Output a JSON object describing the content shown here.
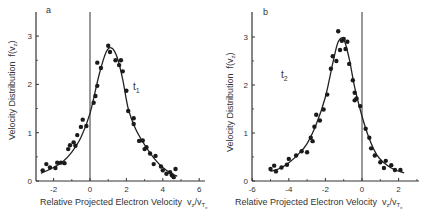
{
  "chart_data": [
    {
      "type": "scatter",
      "panel_label": "a",
      "curve_label": "t",
      "curve_label_sub": "1",
      "xlabel": "Relative Projected Electron Velocity",
      "xlabel_unit": "vz/vTe",
      "ylabel": "Velocity Distribution",
      "ylabel_unit": "f(vz)",
      "xlim": [
        -3,
        6
      ],
      "ylim": [
        0,
        3.5
      ],
      "xticks": [
        -2,
        0,
        2,
        4,
        6
      ],
      "yticks": [
        0,
        1,
        2,
        3
      ],
      "vertical_line_x": 0,
      "grid": false,
      "series": [
        {
          "name": "measured",
          "points": [
            [
              -2.6,
              0.22
            ],
            [
              -2.4,
              0.35
            ],
            [
              -2.2,
              0.28
            ],
            [
              -1.9,
              0.27
            ],
            [
              -1.8,
              0.38
            ],
            [
              -1.6,
              0.38
            ],
            [
              -1.4,
              0.37
            ],
            [
              -1.2,
              0.66
            ],
            [
              -1.1,
              0.74
            ],
            [
              -0.9,
              0.8
            ],
            [
              -0.8,
              0.73
            ],
            [
              -0.7,
              0.95
            ],
            [
              -0.5,
              1.12
            ],
            [
              -0.4,
              1.27
            ],
            [
              -0.2,
              1.14
            ],
            [
              0.2,
              1.62
            ],
            [
              0.3,
              1.76
            ],
            [
              0.4,
              1.97
            ],
            [
              0.4,
              2.45
            ],
            [
              0.6,
              2.34
            ],
            [
              1.0,
              2.8
            ],
            [
              1.1,
              2.67
            ],
            [
              1.4,
              2.5
            ],
            [
              1.6,
              2.4
            ],
            [
              1.7,
              2.5
            ],
            [
              1.8,
              2.27
            ],
            [
              2.0,
              1.87
            ],
            [
              2.1,
              1.45
            ],
            [
              2.4,
              1.3
            ],
            [
              2.4,
              1.18
            ],
            [
              2.7,
              0.83
            ],
            [
              2.9,
              0.84
            ],
            [
              3.0,
              0.66
            ],
            [
              3.1,
              0.7
            ],
            [
              3.3,
              0.57
            ],
            [
              3.5,
              0.35
            ],
            [
              3.6,
              0.52
            ],
            [
              3.9,
              0.3
            ],
            [
              4.0,
              0.22
            ],
            [
              4.2,
              0.15
            ],
            [
              4.4,
              0.18
            ],
            [
              4.5,
              0.12
            ],
            [
              4.6,
              0.08
            ],
            [
              4.7,
              0.25
            ]
          ]
        },
        {
          "name": "fit",
          "points": [
            [
              -2.7,
              0.16
            ],
            [
              -2.0,
              0.28
            ],
            [
              -1.5,
              0.4
            ],
            [
              -1.0,
              0.6
            ],
            [
              -0.5,
              0.9
            ],
            [
              0.0,
              1.4
            ],
            [
              0.5,
              2.2
            ],
            [
              0.9,
              2.68
            ],
            [
              1.2,
              2.75
            ],
            [
              1.5,
              2.55
            ],
            [
              1.8,
              2.1
            ],
            [
              2.1,
              1.5
            ],
            [
              2.5,
              1.08
            ],
            [
              3.0,
              0.75
            ],
            [
              3.5,
              0.48
            ],
            [
              4.0,
              0.28
            ],
            [
              4.5,
              0.15
            ],
            [
              4.8,
              0.1
            ]
          ]
        }
      ]
    },
    {
      "type": "scatter",
      "panel_label": "b",
      "curve_label": "t",
      "curve_label_sub": "2",
      "xlabel": "Relative Projected Electron Velocity",
      "xlabel_unit": "vz/vTe",
      "ylabel": "Velocity Distribution",
      "ylabel_unit": "f(vz)",
      "xlim": [
        -6,
        3
      ],
      "ylim": [
        0,
        3.5
      ],
      "xticks": [
        -6,
        -4,
        -2,
        0,
        2
      ],
      "yticks": [
        0,
        1,
        2,
        3
      ],
      "vertical_line_x": 0,
      "grid": false,
      "series": [
        {
          "name": "measured",
          "points": [
            [
              -5.0,
              0.25
            ],
            [
              -4.8,
              0.32
            ],
            [
              -4.7,
              0.2
            ],
            [
              -4.4,
              0.28
            ],
            [
              -4.1,
              0.34
            ],
            [
              -4.0,
              0.46
            ],
            [
              -3.6,
              0.53
            ],
            [
              -3.3,
              0.62
            ],
            [
              -3.0,
              0.6
            ],
            [
              -2.8,
              0.9
            ],
            [
              -2.7,
              0.83
            ],
            [
              -2.6,
              1.13
            ],
            [
              -2.5,
              1.38
            ],
            [
              -2.3,
              1.26
            ],
            [
              -2.1,
              1.49
            ],
            [
              -1.9,
              1.8
            ],
            [
              -1.7,
              2.34
            ],
            [
              -1.6,
              2.6
            ],
            [
              -1.4,
              2.5
            ],
            [
              -1.3,
              3.12
            ],
            [
              -1.2,
              2.73
            ],
            [
              -1.1,
              2.92
            ],
            [
              -1.0,
              2.96
            ],
            [
              -0.9,
              2.75
            ],
            [
              -0.8,
              2.9
            ],
            [
              -0.7,
              2.44
            ],
            [
              -0.5,
              2.1
            ],
            [
              -0.4,
              1.84
            ],
            [
              -0.4,
              1.68
            ],
            [
              -0.3,
              1.72
            ],
            [
              -0.1,
              1.56
            ],
            [
              0.2,
              1.09
            ],
            [
              0.4,
              0.9
            ],
            [
              0.5,
              0.68
            ],
            [
              0.7,
              0.53
            ],
            [
              1.0,
              0.39
            ],
            [
              1.2,
              0.27
            ],
            [
              1.3,
              0.42
            ],
            [
              1.6,
              0.33
            ],
            [
              1.8,
              0.23
            ],
            [
              2.1,
              0.23
            ]
          ]
        },
        {
          "name": "fit",
          "points": [
            [
              -5.0,
              0.2
            ],
            [
              -4.5,
              0.26
            ],
            [
              -4.0,
              0.38
            ],
            [
              -3.5,
              0.55
            ],
            [
              -3.0,
              0.78
            ],
            [
              -2.5,
              1.18
            ],
            [
              -2.0,
              1.75
            ],
            [
              -1.6,
              2.45
            ],
            [
              -1.3,
              2.9
            ],
            [
              -1.0,
              2.95
            ],
            [
              -0.7,
              2.55
            ],
            [
              -0.4,
              1.95
            ],
            [
              0.0,
              1.35
            ],
            [
              0.4,
              0.88
            ],
            [
              0.8,
              0.55
            ],
            [
              1.2,
              0.38
            ],
            [
              1.7,
              0.25
            ],
            [
              2.3,
              0.17
            ]
          ]
        }
      ]
    }
  ]
}
